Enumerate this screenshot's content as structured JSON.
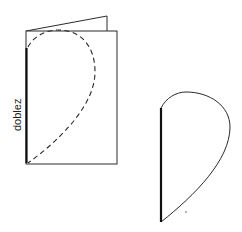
{
  "diagram": {
    "fold_label": "doblez",
    "colors": {
      "line": "#2a2a2a",
      "fold": "#111111",
      "background": "#ffffff"
    },
    "figures": [
      {
        "name": "folded-card",
        "description": "Folded paper with dashed half-heart outline along fold"
      },
      {
        "name": "cut-half-heart",
        "description": "Cut-out half heart with bold fold edge"
      }
    ]
  }
}
